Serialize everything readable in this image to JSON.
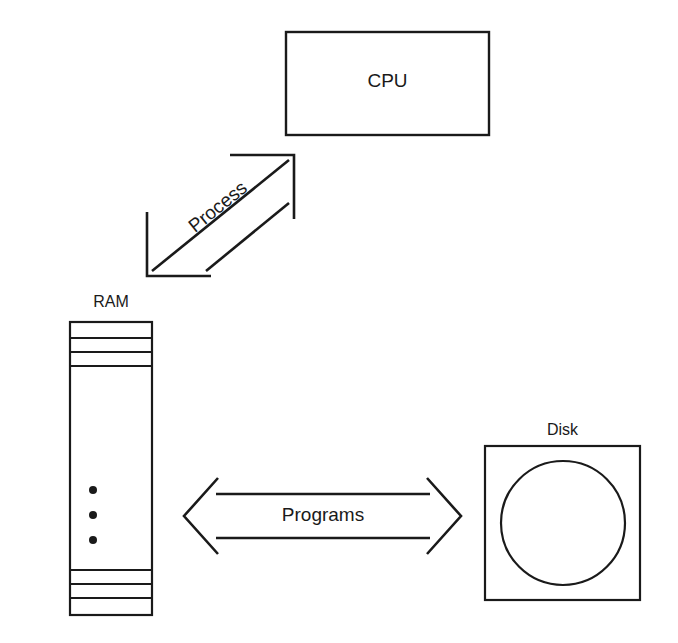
{
  "diagram": {
    "background_color": "#ffffff",
    "stroke_color": "#1a1a1a",
    "nodes": {
      "cpu": {
        "label": "CPU",
        "shape": "rectangle",
        "x": 286,
        "y": 32,
        "width": 203,
        "height": 103
      },
      "ram": {
        "label": "RAM",
        "shape": "banked-rectangle",
        "x": 70,
        "y": 322,
        "width": 82,
        "height": 293,
        "top_divider_y": [
          338,
          352,
          366
        ],
        "bottom_divider_y": [
          570,
          584,
          598
        ],
        "ellipsis_dots": 3,
        "ellipsis_x": 93,
        "ellipsis_y": [
          490,
          515,
          540
        ]
      },
      "disk": {
        "label": "Disk",
        "shape": "square-with-circle",
        "x": 485,
        "y": 446,
        "width": 155,
        "height": 154,
        "circle_cx": 563,
        "circle_cy": 523,
        "circle_r": 62
      }
    },
    "edges": {
      "process": {
        "label": "Process",
        "from": "ram",
        "to": "cpu",
        "style": "double-headed-open-arrow",
        "orientation": "diagonal",
        "rotation_deg": -39
      },
      "programs": {
        "label": "Programs",
        "from": "ram",
        "to": "disk",
        "style": "double-headed-open-arrow",
        "orientation": "horizontal",
        "rotation_deg": 0
      }
    }
  }
}
